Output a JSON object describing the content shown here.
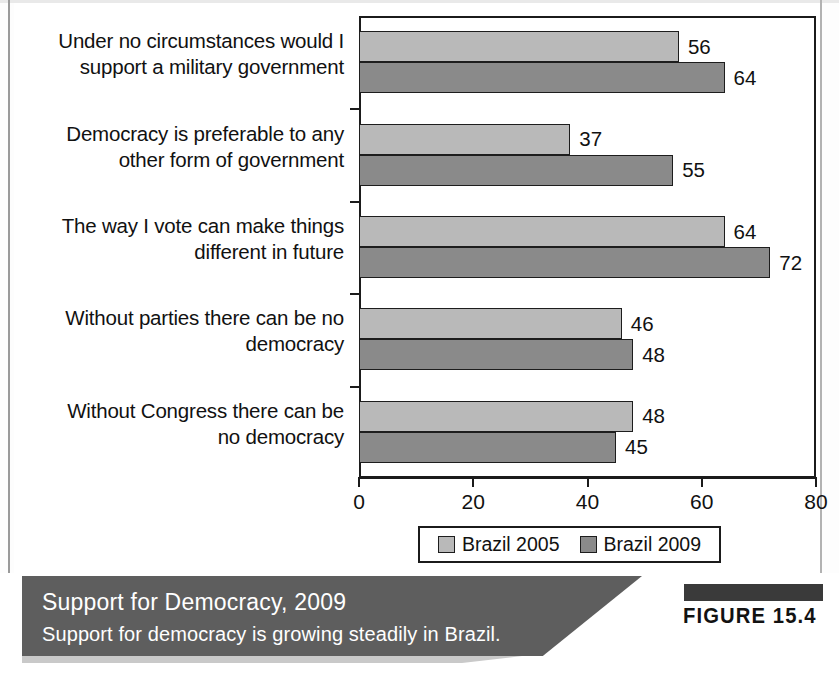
{
  "figure": {
    "tag": "FIGURE 15.4",
    "caption_title": "Support for Democracy, 2009",
    "caption_subtitle": "Support for democracy is growing steadily in Brazil."
  },
  "chart_data": {
    "type": "bar",
    "orientation": "horizontal",
    "title": "Support for Democracy, 2009",
    "subtitle": "Support for democracy is growing steadily in Brazil.",
    "xlabel": "",
    "ylabel": "",
    "xlim": [
      0,
      80
    ],
    "xticks": [
      0,
      20,
      40,
      60,
      80
    ],
    "xtick_labels": [
      "0",
      "20",
      "40",
      "60",
      "80"
    ],
    "grid": false,
    "legend_position": "bottom",
    "categories": [
      "Under no circumstances would I support a military government",
      "Democracy is preferable to any other form of government",
      "The way I vote can make things different in future",
      "Without parties there can be no democracy",
      "Without Congress there can be no democracy"
    ],
    "category_lines": [
      [
        "Under no circumstances would I",
        "support a military government"
      ],
      [
        "Democracy is preferable to any",
        "other form of government"
      ],
      [
        "The way I vote can make things",
        "different in future"
      ],
      [
        "Without parties there can be no",
        "democracy"
      ],
      [
        "Without Congress there can be",
        "no democracy"
      ]
    ],
    "series": [
      {
        "name": "Brazil 2005",
        "color": "#b9b9b9",
        "values": [
          56,
          37,
          64,
          46,
          48
        ],
        "value_labels": [
          "56",
          "37",
          "64",
          "46",
          "48"
        ]
      },
      {
        "name": "Brazil 2009",
        "color": "#8a8a8a",
        "values": [
          64,
          55,
          72,
          48,
          45
        ],
        "value_labels": [
          "64",
          "55",
          "72",
          "48",
          "45"
        ]
      }
    ]
  }
}
